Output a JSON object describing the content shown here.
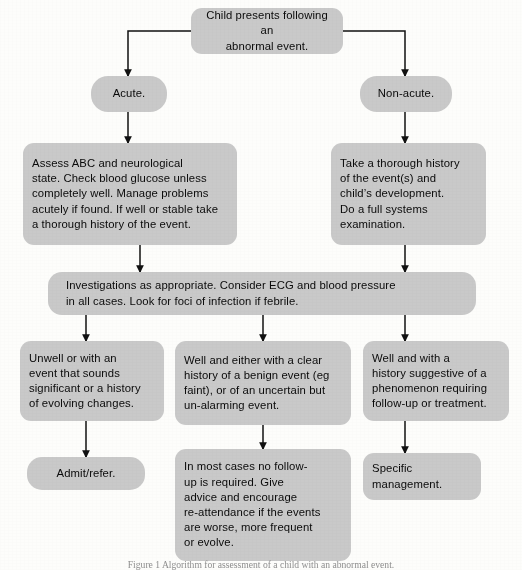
{
  "diagram": {
    "colors": {
      "node_fill": "#c9c9c9",
      "text": "#0a0a0a",
      "connector": "#111111",
      "background": "#fdfdfb"
    },
    "nodes": {
      "root": "Child presents following an\nabnormal event.",
      "acute": "Acute.",
      "non_acute": "Non-acute.",
      "acute_assessment": "Assess ABC and neurological\nstate.  Check blood glucose unless\ncompletely well.  Manage problems\nacutely if found.  If well or stable take\na thorough history of the event.",
      "non_acute_history": "Take a thorough history\nof the event(s) and\nchild’s development.\nDo a full systems\nexamination.",
      "investigations": "Investigations as appropriate.  Consider ECG and blood pressure\nin all cases.  Look for foci of infection if febrile.",
      "branch_unwell": "Unwell or with an\nevent that sounds\nsignificant or a history\nof evolving changes.",
      "branch_well_benign": "Well and either with a clear\nhistory of a benign event (eg\nfaint), or of an uncertain but\nun-alarming event.",
      "branch_well_phenomenon": "Well and with a\nhistory suggestive of a\nphenomenon requiring\nfollow-up or treatment.",
      "outcome_admit": "Admit/refer.",
      "outcome_no_followup": "In most cases no follow-\nup is required.  Give\nadvice and encourage\nre-attendance if the events\nare worse, more frequent\nor evolve.",
      "outcome_specific": "Specific\nmanagement."
    },
    "caption": "Figure 1  Algorithm for assessment of a child with an abnormal event."
  }
}
